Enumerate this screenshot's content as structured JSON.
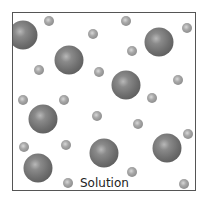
{
  "diagram": {
    "label": "Solution",
    "colors": {
      "border": "#555555",
      "large_particle": "#6e6e6e",
      "small_particle": "#a8a8a8",
      "text": "#222222"
    },
    "large_particles": [
      {
        "x": 22,
        "y": 34
      },
      {
        "x": 68,
        "y": 59
      },
      {
        "x": 158,
        "y": 41
      },
      {
        "x": 125,
        "y": 84
      },
      {
        "x": 42,
        "y": 118
      },
      {
        "x": 103,
        "y": 152
      },
      {
        "x": 166,
        "y": 147
      },
      {
        "x": 37,
        "y": 167
      }
    ],
    "small_particles": [
      {
        "x": 48,
        "y": 20
      },
      {
        "x": 92,
        "y": 33
      },
      {
        "x": 125,
        "y": 20
      },
      {
        "x": 186,
        "y": 27
      },
      {
        "x": 131,
        "y": 50
      },
      {
        "x": 38,
        "y": 69
      },
      {
        "x": 98,
        "y": 71
      },
      {
        "x": 177,
        "y": 79
      },
      {
        "x": 22,
        "y": 99
      },
      {
        "x": 63,
        "y": 99
      },
      {
        "x": 151,
        "y": 97
      },
      {
        "x": 96,
        "y": 115
      },
      {
        "x": 137,
        "y": 123
      },
      {
        "x": 187,
        "y": 133
      },
      {
        "x": 23,
        "y": 146
      },
      {
        "x": 65,
        "y": 144
      },
      {
        "x": 131,
        "y": 171
      },
      {
        "x": 67,
        "y": 182
      },
      {
        "x": 183,
        "y": 183
      }
    ]
  }
}
